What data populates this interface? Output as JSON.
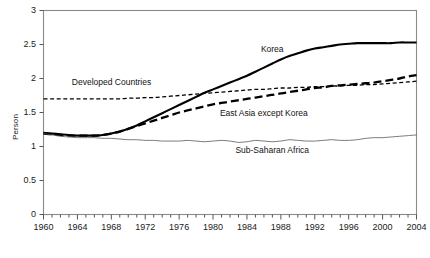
{
  "chart_data": {
    "type": "line",
    "title": "",
    "subtitle": "",
    "xlabel": "",
    "ylabel": "Person",
    "xlim": [
      1960,
      2004
    ],
    "ylim": [
      0,
      3
    ],
    "grid": false,
    "legend_position": "inline-annotations",
    "yticks": [
      "0",
      "0.5",
      "1",
      "1.5",
      "2",
      "2.5",
      "3"
    ],
    "ytick_values": [
      0,
      0.5,
      1,
      1.5,
      2,
      2.5,
      3
    ],
    "xticks": [
      "1960",
      "1964",
      "1968",
      "1972",
      "1976",
      "1980",
      "1984",
      "1988",
      "1992",
      "1996",
      "2000",
      "2004"
    ],
    "xtick_values": [
      1960,
      1964,
      1968,
      1972,
      1976,
      1980,
      1984,
      1988,
      1992,
      1996,
      2000,
      2004
    ],
    "x": [
      1960,
      1961,
      1962,
      1963,
      1964,
      1965,
      1966,
      1967,
      1968,
      1969,
      1970,
      1971,
      1972,
      1973,
      1974,
      1975,
      1976,
      1977,
      1978,
      1979,
      1980,
      1981,
      1982,
      1983,
      1984,
      1985,
      1986,
      1987,
      1988,
      1989,
      1990,
      1991,
      1992,
      1993,
      1994,
      1995,
      1996,
      1997,
      1998,
      1999,
      2000,
      2001,
      2002,
      2003,
      2004
    ],
    "series": [
      {
        "name": "Korea",
        "style": "solid",
        "color": "#000000",
        "width": 2.1,
        "label_x": 1987,
        "label_y": 2.42,
        "values": [
          1.2,
          1.19,
          1.18,
          1.17,
          1.16,
          1.16,
          1.16,
          1.17,
          1.19,
          1.22,
          1.26,
          1.31,
          1.37,
          1.43,
          1.49,
          1.55,
          1.61,
          1.67,
          1.73,
          1.79,
          1.84,
          1.89,
          1.94,
          1.99,
          2.04,
          2.1,
          2.16,
          2.22,
          2.28,
          2.33,
          2.37,
          2.41,
          2.44,
          2.46,
          2.48,
          2.5,
          2.51,
          2.52,
          2.52,
          2.52,
          2.52,
          2.52,
          2.53,
          2.53,
          2.53
        ]
      },
      {
        "name": "Developed Countries",
        "style": "dashed-short",
        "color": "#000000",
        "width": 1.3,
        "label_x": 1968,
        "label_y": 1.93,
        "values": [
          1.7,
          1.7,
          1.7,
          1.7,
          1.7,
          1.7,
          1.7,
          1.7,
          1.7,
          1.7,
          1.71,
          1.71,
          1.72,
          1.72,
          1.73,
          1.74,
          1.75,
          1.76,
          1.77,
          1.78,
          1.79,
          1.8,
          1.81,
          1.82,
          1.83,
          1.84,
          1.84,
          1.85,
          1.86,
          1.86,
          1.87,
          1.87,
          1.88,
          1.88,
          1.89,
          1.89,
          1.9,
          1.9,
          1.91,
          1.91,
          1.92,
          1.93,
          1.94,
          1.95,
          1.96
        ]
      },
      {
        "name": "East Asia except Korea",
        "style": "dashed-long",
        "color": "#000000",
        "width": 2.3,
        "label_x": 1986,
        "label_y": 1.48,
        "values": [
          1.19,
          1.18,
          1.17,
          1.16,
          1.16,
          1.16,
          1.16,
          1.17,
          1.19,
          1.22,
          1.26,
          1.3,
          1.34,
          1.38,
          1.42,
          1.46,
          1.5,
          1.53,
          1.56,
          1.59,
          1.62,
          1.64,
          1.66,
          1.68,
          1.7,
          1.72,
          1.74,
          1.76,
          1.78,
          1.8,
          1.82,
          1.84,
          1.86,
          1.87,
          1.89,
          1.9,
          1.91,
          1.92,
          1.93,
          1.94,
          1.96,
          1.98,
          2.0,
          2.03,
          2.05
        ]
      },
      {
        "name": "Sub-Saharan Africa",
        "style": "solid-thin",
        "color": "#555555",
        "width": 0.8,
        "label_x": 1987,
        "label_y": 0.94,
        "values": [
          1.19,
          1.17,
          1.15,
          1.14,
          1.13,
          1.13,
          1.13,
          1.12,
          1.12,
          1.11,
          1.1,
          1.1,
          1.09,
          1.09,
          1.08,
          1.08,
          1.08,
          1.09,
          1.08,
          1.07,
          1.08,
          1.09,
          1.08,
          1.06,
          1.07,
          1.09,
          1.08,
          1.07,
          1.08,
          1.1,
          1.09,
          1.08,
          1.08,
          1.09,
          1.1,
          1.09,
          1.09,
          1.1,
          1.12,
          1.13,
          1.13,
          1.14,
          1.15,
          1.16,
          1.17
        ]
      }
    ]
  }
}
